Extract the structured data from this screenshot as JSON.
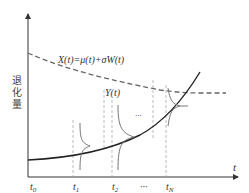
{
  "diagram": {
    "y_axis_label": "退化量",
    "x_axis_label": "t",
    "process_label": "X(t)=μ(t)+σW(t)",
    "threshold_label": "Y(t)",
    "ticks": [
      {
        "main": "t",
        "sub": "0"
      },
      {
        "main": "t",
        "sub": "1"
      },
      {
        "main": "t",
        "sub": "2"
      },
      {
        "main": "···",
        "sub": ""
      },
      {
        "main": "t",
        "sub": "N"
      }
    ],
    "ellipsis_mid": "···",
    "colors": {
      "axis": "#333333",
      "process_curve": "#222222",
      "threshold_curve": "#666666",
      "guide": "#aaaaaa",
      "pdf": "#777777"
    }
  }
}
